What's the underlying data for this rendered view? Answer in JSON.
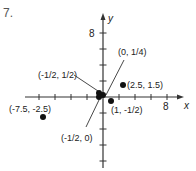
{
  "problem": {
    "number": "7."
  },
  "chart_data": {
    "type": "scatter",
    "title": "",
    "xlabel": "x",
    "ylabel": "y",
    "xlim": [
      -9,
      10
    ],
    "ylim": [
      -8,
      10
    ],
    "tick_interval": 2,
    "x_tick_labels": [
      {
        "value": 8,
        "label": "8"
      }
    ],
    "y_tick_labels": [
      {
        "value": 8,
        "label": "8"
      }
    ],
    "grid": false,
    "points": [
      {
        "x": -7.5,
        "y": -2.5,
        "label": "(-7.5, -2.5)"
      },
      {
        "x": 2.5,
        "y": 1.5,
        "label": "(2.5, 1.5)"
      },
      {
        "x": 0,
        "y": 0.25,
        "label": "(0, 1/4)"
      },
      {
        "x": -0.5,
        "y": 0.5,
        "label": "(-1/2, 1/2)"
      },
      {
        "x": -0.5,
        "y": 0,
        "label": "(-1/2, 0)"
      },
      {
        "x": 1,
        "y": -0.5,
        "label": "(1, -1/2)"
      }
    ]
  }
}
